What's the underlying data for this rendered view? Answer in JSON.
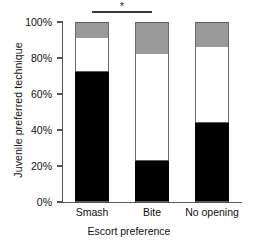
{
  "chart_data": {
    "type": "bar",
    "stacked": true,
    "title": "",
    "xlabel": "Escort preference",
    "ylabel": "Juvenile preferred technique",
    "categories": [
      "Smash",
      "Bite",
      "No opening"
    ],
    "ylim": [
      0,
      100
    ],
    "yticks": [
      0,
      20,
      40,
      60,
      80,
      100
    ],
    "ytick_labels": [
      "0%",
      "20%",
      "40%",
      "60%",
      "80%",
      "100%"
    ],
    "grid": false,
    "legend": "none",
    "series": [
      {
        "name": "Smash (black)",
        "color": "#000000",
        "values": [
          72,
          23,
          44
        ]
      },
      {
        "name": "Bite (white)",
        "color": "#ffffff",
        "values": [
          19,
          59,
          42
        ]
      },
      {
        "name": "No opening (gray)",
        "color": "#9a9a9a",
        "values": [
          9,
          18,
          14
        ]
      }
    ],
    "annotations": [
      {
        "type": "significance-bracket",
        "label": "*",
        "from": "Smash",
        "to": "Bite",
        "y": 106
      }
    ]
  }
}
